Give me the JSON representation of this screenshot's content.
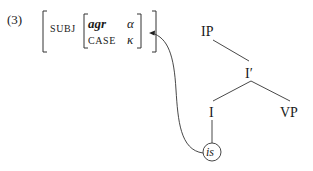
{
  "example": {
    "number": "(3)",
    "avm": {
      "outer_attribute": "SUBJ",
      "inner": [
        {
          "attribute": "agr",
          "value": "α"
        },
        {
          "attribute": "CASE",
          "value": "κ"
        }
      ]
    }
  },
  "tree": {
    "root": "IP",
    "intermediate": "I′",
    "head": "I",
    "complement": "VP",
    "terminal": "is"
  },
  "arrow": {
    "from": "is",
    "to": "SUBJ AVM"
  }
}
